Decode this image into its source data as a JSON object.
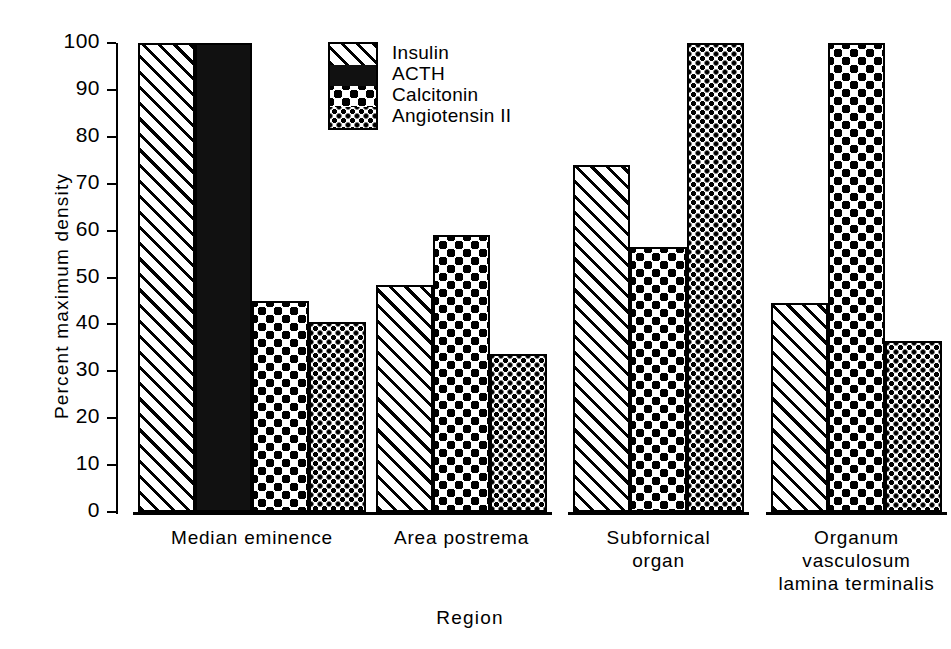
{
  "chart_data": {
    "type": "bar",
    "title": "",
    "xlabel": "Region",
    "ylabel": "Percent maximum density",
    "ylim": [
      0,
      100
    ],
    "yticks": [
      0,
      10,
      20,
      30,
      40,
      50,
      60,
      70,
      80,
      90,
      100
    ],
    "ytick_labels": [
      "0",
      "10",
      "20",
      "30",
      "40",
      "50",
      "60",
      "70",
      "80",
      "90",
      "100"
    ],
    "grid": false,
    "legend_position": "top-center-left",
    "categories": [
      "Median eminence",
      "Area postrema",
      "Subfornical organ",
      "Organum vasculosum lamina terminalis"
    ],
    "category_lines": [
      [
        "Median eminence"
      ],
      [
        "Area postrema"
      ],
      [
        "Subfornical",
        "organ"
      ],
      [
        "Organum",
        "vasculosum",
        "lamina terminalis"
      ]
    ],
    "series": [
      {
        "name": "Insulin",
        "pattern": "diagonal-hatch",
        "values": [
          100,
          48.5,
          74,
          44.5
        ]
      },
      {
        "name": "ACTH",
        "pattern": "solid-black",
        "values": [
          100,
          null,
          null,
          null
        ]
      },
      {
        "name": "Calcitonin",
        "pattern": "large-dots",
        "values": [
          45,
          59,
          56.5,
          100
        ]
      },
      {
        "name": "Angiotensin II",
        "pattern": "fine-dots",
        "values": [
          40.5,
          33.7,
          100,
          36.5
        ]
      }
    ]
  },
  "legend": {
    "items": [
      {
        "label": "Insulin",
        "pattern": "diagonal-hatch"
      },
      {
        "label": "ACTH",
        "pattern": "solid-black"
      },
      {
        "label": "Calcitonin",
        "pattern": "large-dots"
      },
      {
        "label": "Angiotensin II",
        "pattern": "fine-dots"
      }
    ]
  },
  "axes": {
    "y_title": "Percent maximum density",
    "x_title": "Region",
    "y_tick_labels": [
      "100",
      "90",
      "80",
      "70",
      "60",
      "50",
      "40",
      "30",
      "20",
      "10",
      "0"
    ]
  },
  "colors": {
    "ink": "#000000",
    "paper": "#ffffff"
  }
}
